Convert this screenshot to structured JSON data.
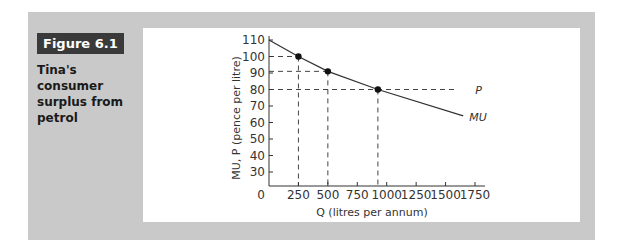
{
  "figure": {
    "label": "Figure 6.1",
    "caption": "Tina's consumer surplus from petrol"
  },
  "chart_data": {
    "type": "line",
    "title": "Tina's consumer surplus from petrol",
    "xlabel": "Q (litres per annum)",
    "ylabel": "MU, P (pence per litre)",
    "xlim": [
      0,
      1750
    ],
    "ylim": [
      30,
      110
    ],
    "y_origin_label": "0",
    "x_ticks": [
      250,
      500,
      750,
      1000,
      1250,
      1500,
      1750
    ],
    "x_tick_labels": [
      "250",
      "500",
      "750",
      "1000",
      "1250",
      "1500",
      "1750"
    ],
    "y_ticks": [
      30,
      40,
      50,
      60,
      70,
      80,
      90,
      100,
      110
    ],
    "y_tick_labels": [
      "30",
      "40",
      "50",
      "60",
      "70",
      "80",
      "90",
      "100",
      "110"
    ],
    "grid": false,
    "series": [
      {
        "name": "MU",
        "x": [
          0,
          250,
          500,
          925,
          1650
        ],
        "y": [
          110,
          100,
          91,
          80,
          64
        ]
      }
    ],
    "points": [
      {
        "x": 250,
        "y": 100
      },
      {
        "x": 500,
        "y": 91
      },
      {
        "x": 925,
        "y": 80
      }
    ],
    "price_line": {
      "name": "P",
      "y": 80
    },
    "annotations": [
      "P",
      "MU"
    ]
  }
}
